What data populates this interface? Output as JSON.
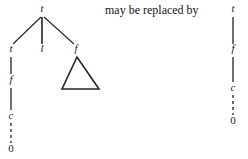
{
  "figure": {
    "connective_text": "may be replaced by",
    "left_tree": {
      "root": {
        "label": "t",
        "x": 42,
        "y": 10
      },
      "children": [
        {
          "label": "t",
          "x": 11,
          "y": 50
        },
        {
          "label": "l",
          "x": 42,
          "y": 50
        },
        {
          "label": "f",
          "x": 76,
          "y": 50
        }
      ],
      "left_chain": [
        {
          "label": "f",
          "x": 11,
          "y": 81
        },
        {
          "label": "c",
          "x": 11,
          "y": 117
        },
        {
          "label": "0",
          "x": 11,
          "y": 150
        }
      ],
      "triangle": {
        "apex_x": 77,
        "apex_y": 57,
        "left_x": 62,
        "right_x": 99,
        "base_y": 89
      }
    },
    "right_tree": {
      "chain": [
        {
          "label": "t",
          "x": 233,
          "y": 10
        },
        {
          "label": "f",
          "x": 233,
          "y": 50
        },
        {
          "label": "c",
          "x": 233,
          "y": 89
        },
        {
          "label": "0",
          "x": 233,
          "y": 122
        }
      ]
    },
    "colors": {
      "ink": "#1c1c1c",
      "line": "#232323",
      "background": "#ffffff"
    }
  }
}
